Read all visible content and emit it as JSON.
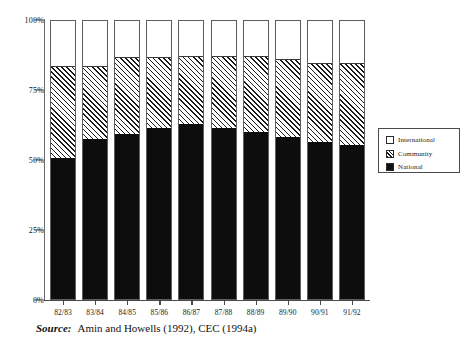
{
  "chart_data": {
    "type": "bar",
    "stacked": true,
    "title": "",
    "xlabel": "",
    "ylabel": "",
    "ylim": [
      0,
      100
    ],
    "ytick_labels": [
      "0%",
      "25%",
      "50%",
      "75%",
      "100%"
    ],
    "ytick_values": [
      0,
      25,
      50,
      75,
      100
    ],
    "grid": false,
    "legend_position": "right",
    "categories": [
      "82/83",
      "83/84",
      "84/85",
      "85/86",
      "86/87",
      "87/88",
      "88/89",
      "89/90",
      "90/91",
      "91/92"
    ],
    "series": [
      {
        "name": "National",
        "color": "#0d0d0d",
        "fill": "solid",
        "values": [
          50.5,
          57.0,
          59.0,
          61.0,
          62.5,
          61.0,
          59.5,
          58.0,
          56.0,
          55.0
        ]
      },
      {
        "name": "Community",
        "color": "#1a1a1a",
        "fill": "hatched",
        "values": [
          33.5,
          27.0,
          28.0,
          26.0,
          25.0,
          26.5,
          28.0,
          28.5,
          29.0,
          30.0
        ]
      },
      {
        "name": "International",
        "color": "#ffffff",
        "fill": "empty",
        "values": [
          16.0,
          16.0,
          13.0,
          13.0,
          12.5,
          12.5,
          12.5,
          13.5,
          15.0,
          15.0
        ]
      }
    ],
    "cumulative_tops": {
      "national": [
        50.5,
        57.0,
        59.0,
        61.0,
        62.5,
        61.0,
        59.5,
        58.0,
        56.0,
        55.0
      ],
      "community": [
        84.0,
        84.0,
        87.0,
        87.0,
        87.5,
        87.5,
        87.5,
        86.5,
        85.0,
        85.0
      ]
    }
  },
  "legend": {
    "items": [
      {
        "label": "International",
        "swatch": "white-square-icon"
      },
      {
        "label": "Community",
        "swatch": "hatched-square-icon"
      },
      {
        "label": "National",
        "swatch": "black-square-icon"
      }
    ]
  },
  "source": {
    "prefix": "Source:",
    "text": "Amin and Howells (1992), CEC (1994a)"
  }
}
